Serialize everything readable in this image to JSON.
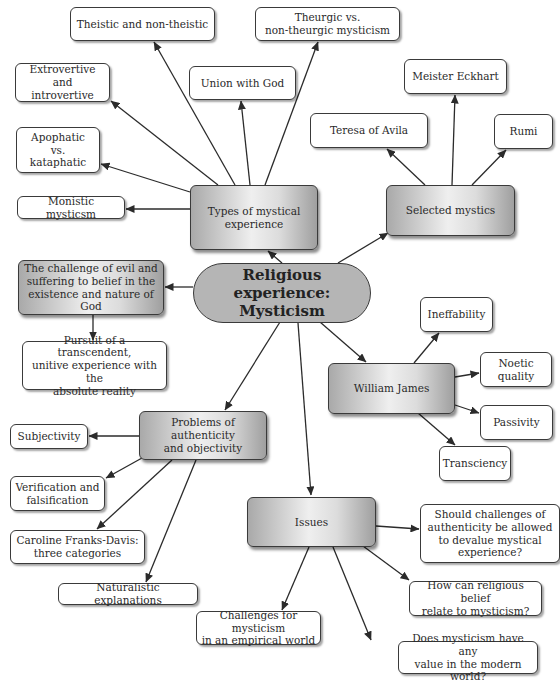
{
  "diagram": {
    "type": "concept-map",
    "central": {
      "id": "central",
      "label": "Religious experience:\nMysticism",
      "x": 193,
      "y": 263,
      "w": 178,
      "h": 60
    },
    "nodes": [
      {
        "id": "types",
        "label": "Types of mystical\nexperience",
        "style": "main",
        "x": 190,
        "y": 185,
        "w": 128,
        "h": 65
      },
      {
        "id": "theistic",
        "label": "Theistic and non-theistic",
        "style": "leaf",
        "x": 70,
        "y": 7,
        "w": 145,
        "h": 34
      },
      {
        "id": "theurgic",
        "label": "Theurgic vs.\nnon-theurgic mysticism",
        "style": "leaf",
        "x": 255,
        "y": 7,
        "w": 145,
        "h": 34
      },
      {
        "id": "extrovertive",
        "label": "Extrovertive and\nintrovertive",
        "style": "leaf",
        "x": 15,
        "y": 63,
        "w": 95,
        "h": 39
      },
      {
        "id": "union",
        "label": "Union with God",
        "style": "leaf",
        "x": 189,
        "y": 66,
        "w": 107,
        "h": 34
      },
      {
        "id": "apophatic",
        "label": "Apophatic\nvs.\nkataphatic",
        "style": "leaf",
        "x": 16,
        "y": 127,
        "w": 84,
        "h": 46
      },
      {
        "id": "monistic",
        "label": "Monistic mysticsm",
        "style": "leaf",
        "x": 17,
        "y": 196,
        "w": 108,
        "h": 23
      },
      {
        "id": "selected",
        "label": "Selected mystics",
        "style": "main",
        "x": 386,
        "y": 185,
        "w": 129,
        "h": 51
      },
      {
        "id": "eckhart",
        "label": "Meister Eckhart",
        "style": "leaf",
        "x": 404,
        "y": 59,
        "w": 103,
        "h": 35
      },
      {
        "id": "teresa",
        "label": "Teresa of Avila",
        "style": "leaf",
        "x": 310,
        "y": 113,
        "w": 118,
        "h": 35
      },
      {
        "id": "rumi",
        "label": "Rumi",
        "style": "leaf",
        "x": 494,
        "y": 114,
        "w": 59,
        "h": 35
      },
      {
        "id": "evil",
        "label": "The challenge of evil and\nsuffering to belief in the\nexistence and nature of God",
        "style": "main",
        "x": 18,
        "y": 260,
        "w": 146,
        "h": 55
      },
      {
        "id": "pursuit",
        "label": "Pursuit of a transcendent,\nunitive experience with the\nabsolute reality",
        "style": "leaf",
        "x": 22,
        "y": 341,
        "w": 145,
        "h": 49
      },
      {
        "id": "james",
        "label": "William James",
        "style": "main",
        "x": 328,
        "y": 363,
        "w": 127,
        "h": 51
      },
      {
        "id": "ineffability",
        "label": "Ineffability",
        "style": "leaf",
        "x": 420,
        "y": 297,
        "w": 73,
        "h": 35
      },
      {
        "id": "noetic",
        "label": "Noetic\nquality",
        "style": "leaf",
        "x": 480,
        "y": 352,
        "w": 72,
        "h": 35
      },
      {
        "id": "passivity",
        "label": "Passivity",
        "style": "leaf",
        "x": 480,
        "y": 405,
        "w": 73,
        "h": 35
      },
      {
        "id": "transciency",
        "label": "Transciency",
        "style": "leaf",
        "x": 439,
        "y": 446,
        "w": 72,
        "h": 35
      },
      {
        "id": "problems",
        "label": "Problems of authenticity\nand objectivity",
        "style": "main",
        "x": 139,
        "y": 411,
        "w": 128,
        "h": 49
      },
      {
        "id": "subjectivity",
        "label": "Subjectivity",
        "style": "leaf",
        "x": 10,
        "y": 424,
        "w": 78,
        "h": 25
      },
      {
        "id": "verification",
        "label": "Verification and\nfalsification",
        "style": "leaf",
        "x": 10,
        "y": 476,
        "w": 95,
        "h": 35
      },
      {
        "id": "caroline",
        "label": "Caroline Franks-Davis:\nthree categories",
        "style": "leaf",
        "x": 10,
        "y": 530,
        "w": 135,
        "h": 34
      },
      {
        "id": "naturalistic",
        "label": "Naturalistic explanations",
        "style": "leaf",
        "x": 58,
        "y": 583,
        "w": 140,
        "h": 22
      },
      {
        "id": "issues",
        "label": "Issues",
        "style": "main",
        "x": 247,
        "y": 497,
        "w": 129,
        "h": 50
      },
      {
        "id": "should",
        "label": "Should challenges of\nauthenticity be allowed\nto devalue mystical\nexperience?",
        "style": "leaf",
        "x": 420,
        "y": 504,
        "w": 140,
        "h": 59
      },
      {
        "id": "howcan",
        "label": "How can religious belief\nrelate to mysticism?",
        "style": "leaf",
        "x": 409,
        "y": 581,
        "w": 133,
        "h": 35
      },
      {
        "id": "challenges",
        "label": "Challenges for mysticism\nin an empirical world",
        "style": "leaf",
        "x": 196,
        "y": 611,
        "w": 125,
        "h": 34
      },
      {
        "id": "doesvalue",
        "label": "Does mysticism have any\nvalue in the modern world?",
        "style": "leaf",
        "x": 398,
        "y": 641,
        "w": 140,
        "h": 33
      }
    ],
    "edges": [
      {
        "from": "central",
        "to": "types",
        "x1": 282,
        "y1": 263,
        "x2": 268,
        "y2": 251
      },
      {
        "from": "central",
        "to": "selected",
        "x1": 338,
        "y1": 263,
        "x2": 388,
        "y2": 233
      },
      {
        "from": "central",
        "to": "evil",
        "x1": 193,
        "y1": 287,
        "x2": 165,
        "y2": 287
      },
      {
        "from": "central",
        "to": "james",
        "x1": 320,
        "y1": 322,
        "x2": 366,
        "y2": 362
      },
      {
        "from": "central",
        "to": "problems",
        "x1": 280,
        "y1": 322,
        "x2": 225,
        "y2": 410
      },
      {
        "from": "central",
        "to": "issues",
        "x1": 298,
        "y1": 323,
        "x2": 311,
        "y2": 495
      },
      {
        "from": "types",
        "to": "theistic",
        "x1": 235,
        "y1": 185,
        "x2": 154,
        "y2": 42
      },
      {
        "from": "types",
        "to": "theurgic",
        "x1": 265,
        "y1": 185,
        "x2": 318,
        "y2": 42
      },
      {
        "from": "types",
        "to": "extrovertive",
        "x1": 218,
        "y1": 185,
        "x2": 111,
        "y2": 101
      },
      {
        "from": "types",
        "to": "union",
        "x1": 250,
        "y1": 185,
        "x2": 241,
        "y2": 101
      },
      {
        "from": "types",
        "to": "apophatic",
        "x1": 190,
        "y1": 192,
        "x2": 101,
        "y2": 164
      },
      {
        "from": "types",
        "to": "monistic",
        "x1": 190,
        "y1": 209,
        "x2": 126,
        "y2": 209
      },
      {
        "from": "selected",
        "to": "eckhart",
        "x1": 452,
        "y1": 185,
        "x2": 455,
        "y2": 95
      },
      {
        "from": "selected",
        "to": "teresa",
        "x1": 425,
        "y1": 185,
        "x2": 387,
        "y2": 149
      },
      {
        "from": "selected",
        "to": "rumi",
        "x1": 472,
        "y1": 185,
        "x2": 506,
        "y2": 150
      },
      {
        "from": "evil",
        "to": "pursuit",
        "x1": 93,
        "y1": 315,
        "x2": 93,
        "y2": 340
      },
      {
        "from": "james",
        "to": "ineffability",
        "x1": 414,
        "y1": 363,
        "x2": 439,
        "y2": 333
      },
      {
        "from": "james",
        "to": "noetic",
        "x1": 455,
        "y1": 377,
        "x2": 479,
        "y2": 373
      },
      {
        "from": "james",
        "to": "passivity",
        "x1": 455,
        "y1": 405,
        "x2": 479,
        "y2": 413
      },
      {
        "from": "james",
        "to": "transciency",
        "x1": 418,
        "y1": 413,
        "x2": 455,
        "y2": 445
      },
      {
        "from": "problems",
        "to": "subjectivity",
        "x1": 139,
        "y1": 436,
        "x2": 89,
        "y2": 436
      },
      {
        "from": "problems",
        "to": "verification",
        "x1": 142,
        "y1": 458,
        "x2": 106,
        "y2": 478
      },
      {
        "from": "problems",
        "to": "caroline",
        "x1": 172,
        "y1": 460,
        "x2": 97,
        "y2": 529
      },
      {
        "from": "problems",
        "to": "naturalistic",
        "x1": 196,
        "y1": 460,
        "x2": 146,
        "y2": 582
      },
      {
        "from": "issues",
        "to": "should",
        "x1": 376,
        "y1": 526,
        "x2": 419,
        "y2": 529
      },
      {
        "from": "issues",
        "to": "howcan",
        "x1": 363,
        "y1": 546,
        "x2": 409,
        "y2": 580
      },
      {
        "from": "issues",
        "to": "challenges",
        "x1": 309,
        "y1": 547,
        "x2": 282,
        "y2": 610
      },
      {
        "from": "issues",
        "to": "doesvalue",
        "x1": 333,
        "y1": 547,
        "x2": 371,
        "y2": 640
      }
    ]
  },
  "colors": {
    "line": "#2b2b2b",
    "border": "#3a3a3a",
    "central_fill": "#b5b5b5",
    "leaf_fill": "#ffffff",
    "text": "#2a2a2a"
  }
}
